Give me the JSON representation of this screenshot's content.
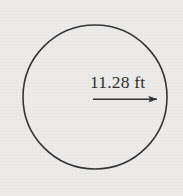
{
  "figure": {
    "background_color": "#ecebe9",
    "stroke_color": "#333333",
    "text_color": "#2e2e2e",
    "shape": {
      "type": "circle",
      "center_x": 95,
      "center_y": 97,
      "radius_px": 72,
      "stroke_width": 1.6
    },
    "dimension": {
      "kind": "radius",
      "label": "11.28 ft",
      "value": 11.28,
      "unit": "ft",
      "arrow_from_x": 93,
      "arrow_from_y": 99,
      "arrow_to_x": 164,
      "arrow_to_y": 99,
      "label_x": 90,
      "label_y": 88
    }
  },
  "diagram_data": {
    "type": "geometry",
    "elements": [
      {
        "name": "circle",
        "shape": "circle",
        "center": [
          95,
          97
        ],
        "radius": 72
      },
      {
        "name": "radius-arrow",
        "shape": "arrow",
        "from": [
          93,
          99
        ],
        "to": [
          164,
          99
        ],
        "label": "11.28 ft"
      }
    ],
    "labels": [
      "11.28 ft"
    ]
  }
}
